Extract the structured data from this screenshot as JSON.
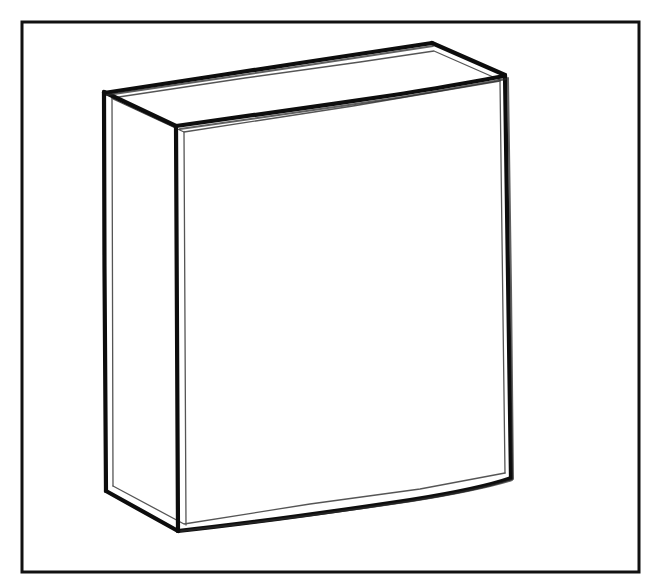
{
  "artwork": {
    "title": "Rectangular Box",
    "subject": "cardboard-carton",
    "style": "hand-drawn ink line drawing",
    "medium": "black ink outline on white paper",
    "shading": "none",
    "fill": "unfilled / white",
    "canvas": {
      "width": 662,
      "height": 586,
      "background_color": "#ffffff"
    },
    "frame": {
      "present": true,
      "shape": "rectangle",
      "stroke_color": "#111111",
      "stroke_width": 3,
      "x": 22,
      "y": 22,
      "width": 617,
      "height": 550
    },
    "ink": {
      "primary_color": "#0d0d0d",
      "secondary_color": "#2b2b2b",
      "hairline_color": "#555555",
      "main_stroke_width": 4.2,
      "inner_stroke_width": 1.3,
      "line_character": "doubled, slightly wavering freehand contour"
    },
    "object": {
      "name": "box",
      "projection": "three-quarter oblique / two-point perspective",
      "visible_faces": [
        "top",
        "left-side",
        "front"
      ],
      "vertices": {
        "top_back_left": [
          104,
          92
        ],
        "top_back_right": [
          432,
          43
        ],
        "top_front_right": [
          505,
          75
        ],
        "top_front_left": [
          176,
          126
        ],
        "bottom_front_left": [
          178,
          531
        ],
        "bottom_front_right": [
          511,
          478
        ],
        "bottom_left": [
          106,
          491
        ]
      },
      "faces": [
        {
          "name": "top-face",
          "points": "104,92 432,43 505,75 176,126",
          "note": "narrow lid band, brightest plane"
        },
        {
          "name": "left-side-face",
          "points": "104,92 176,126 178,531 106,491",
          "note": "thin vertical side panel"
        },
        {
          "name": "front-face",
          "points": "176,126 505,75 511,478 178,531",
          "note": "large main panel, blank"
        }
      ],
      "edges": [
        {
          "name": "top-back-edge",
          "from": [
            104,
            92
          ],
          "to": [
            432,
            43
          ]
        },
        {
          "name": "top-right-edge",
          "from": [
            432,
            43
          ],
          "to": [
            505,
            75
          ]
        },
        {
          "name": "top-front-edge",
          "from": [
            176,
            126
          ],
          "to": [
            505,
            75
          ]
        },
        {
          "name": "top-left-edge",
          "from": [
            104,
            92
          ],
          "to": [
            176,
            126
          ]
        },
        {
          "name": "front-left-vertical-edge",
          "from": [
            176,
            126
          ],
          "to": [
            178,
            531
          ]
        },
        {
          "name": "right-vertical-edge",
          "from": [
            505,
            75
          ],
          "to": [
            511,
            478
          ]
        },
        {
          "name": "left-vertical-edge",
          "from": [
            104,
            92
          ],
          "to": [
            106,
            491
          ]
        },
        {
          "name": "bottom-front-edge",
          "from": [
            178,
            531
          ],
          "to": [
            511,
            478
          ]
        },
        {
          "name": "bottom-left-edge",
          "from": [
            106,
            491
          ],
          "to": [
            178,
            531
          ]
        }
      ]
    }
  }
}
